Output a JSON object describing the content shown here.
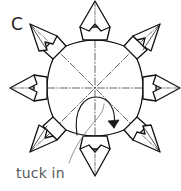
{
  "figure": {
    "step_label": "C",
    "caption": "tuck in",
    "title": "",
    "type": "origami-folding-diagram",
    "colors": {
      "background": "#ffffff",
      "outline": "#111111",
      "fold_line": "#4a4a4a",
      "leader_line": "#8c8c8c",
      "caption_text": "#5a5a5a",
      "label_text": "#1d1d1d"
    },
    "geometry": {
      "center_x": 95,
      "center_y": 88,
      "point_count": 8,
      "outer_radius": 72,
      "inner_radius": 43,
      "symmetry_axes": 4
    },
    "annotations": [
      {
        "name": "tuck-in-callout",
        "text": "tuck in",
        "text_x": 16,
        "text_y": 166,
        "target_x": 104,
        "target_y": 105
      },
      {
        "name": "tuck-arrow",
        "text": "",
        "kind": "curved-fold-arrow"
      }
    ],
    "icons": {
      "arrow": "curved-arrow-icon",
      "axis": "dash-dot-axis-icon"
    }
  }
}
